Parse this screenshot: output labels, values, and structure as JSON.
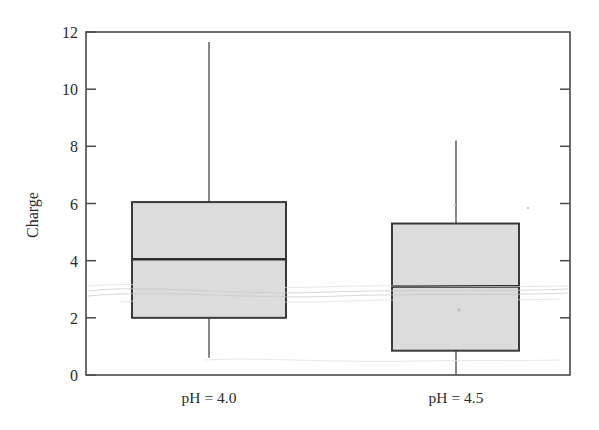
{
  "chart_data": {
    "type": "box",
    "title": "",
    "xlabel": "",
    "ylabel": "Charge",
    "ylim": [
      0,
      12
    ],
    "yticks": [
      0,
      2,
      4,
      6,
      8,
      10,
      12
    ],
    "ytick_labels": [
      "0",
      "2",
      "4",
      "6",
      "8",
      "10",
      "12"
    ],
    "grid": false,
    "legend": null,
    "categories": [
      "pH = 4.0",
      "pH = 4.5"
    ],
    "boxes": [
      {
        "category": "pH = 4.0",
        "whisker_low": 0.6,
        "q1": 2.0,
        "median": 4.05,
        "q3": 6.05,
        "whisker_high": 11.65,
        "fill": "#dcdcdc"
      },
      {
        "category": "pH = 4.5",
        "whisker_low": 0.0,
        "q1": 0.85,
        "median": 3.1,
        "q3": 5.3,
        "whisker_high": 8.2,
        "fill": "#dcdcdc"
      }
    ],
    "colors": {
      "box_fill": "#dcdcdc",
      "box_edge": "#3a3a3a",
      "median": "#2e2e2e",
      "axis": "#4a4a4a",
      "text": "#2b2b2b",
      "background": "#ffffff"
    }
  },
  "axes": {
    "y_title": "Charge",
    "y_tick_0": "0",
    "y_tick_2": "2",
    "y_tick_4": "4",
    "y_tick_6": "6",
    "y_tick_8": "8",
    "y_tick_10": "10",
    "y_tick_12": "12"
  },
  "category_labels": {
    "first": "pH = 4.0",
    "second": "pH = 4.5"
  }
}
